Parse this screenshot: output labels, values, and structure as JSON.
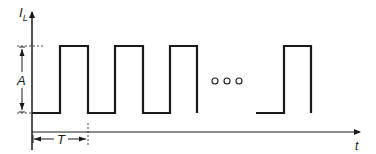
{
  "diagram": {
    "type": "pulse-waveform",
    "y_axis_label": "I",
    "y_axis_label_subscript": "L",
    "x_axis_label": "t",
    "amplitude_label": "A",
    "period_label": "T",
    "continuation_marker": "o o o",
    "visible_pulses_before_gap": 3,
    "visible_pulses_after_gap": 1,
    "stroke_color": "#1a1a1a",
    "background_color": "#ffffff"
  }
}
